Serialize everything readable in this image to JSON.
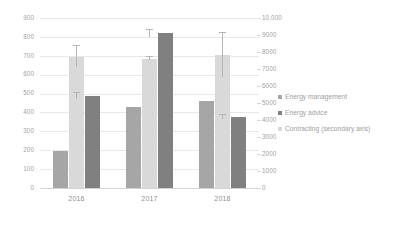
{
  "chart_data": {
    "type": "bar",
    "title": "",
    "subtitle": "",
    "xlabel": "",
    "ylabel": "",
    "grid": true,
    "legend_position": "right",
    "categories": [
      "2016",
      "2017",
      "2018"
    ],
    "primary_axis": {
      "side": "left",
      "min": 0,
      "max": 900,
      "step": 100,
      "ticks": [
        "0",
        "100",
        "200",
        "300",
        "400",
        "500",
        "600",
        "700",
        "800",
        "900"
      ]
    },
    "secondary_axis": {
      "side": "right",
      "min": 0,
      "max": 10000,
      "step": 1000,
      "ticks": [
        "0",
        "1000",
        "2000",
        "3000",
        "4000",
        "5000",
        "6000",
        "7000",
        "8000",
        "9000",
        "10,000"
      ]
    },
    "series": [
      {
        "name": "Energy management",
        "axis": "primary",
        "color": "#a6a6a6",
        "values": [
          195,
          430,
          460
        ],
        "error_upper": [
          25,
          25,
          18
        ],
        "error_lower": [
          25,
          25,
          18
        ]
      },
      {
        "name": "Energy advice",
        "axis": "primary",
        "color": "#d9d9d9",
        "values": [
          695,
          685,
          705
        ],
        "error_upper": [
          55,
          8,
          115
        ],
        "error_lower": [
          55,
          8,
          115
        ]
      },
      {
        "name": "Contracting (secondary axis)",
        "axis": "secondary",
        "color": "#808080",
        "values": [
          5400,
          9100,
          4200
        ],
        "error_upper": [
          170,
          200,
          120
        ],
        "error_lower": [
          170,
          200,
          120
        ]
      }
    ]
  },
  "legend": {
    "items": [
      {
        "label": "Energy management",
        "color": "#a6a6a6",
        "marker": "square-swatch-icon"
      },
      {
        "label": "Energy advice",
        "color": "#808080",
        "marker": "square-swatch-icon"
      },
      {
        "label": "Contracting (secondary axis)",
        "color": "#d9d9d9",
        "marker": "square-swatch-icon"
      }
    ]
  }
}
